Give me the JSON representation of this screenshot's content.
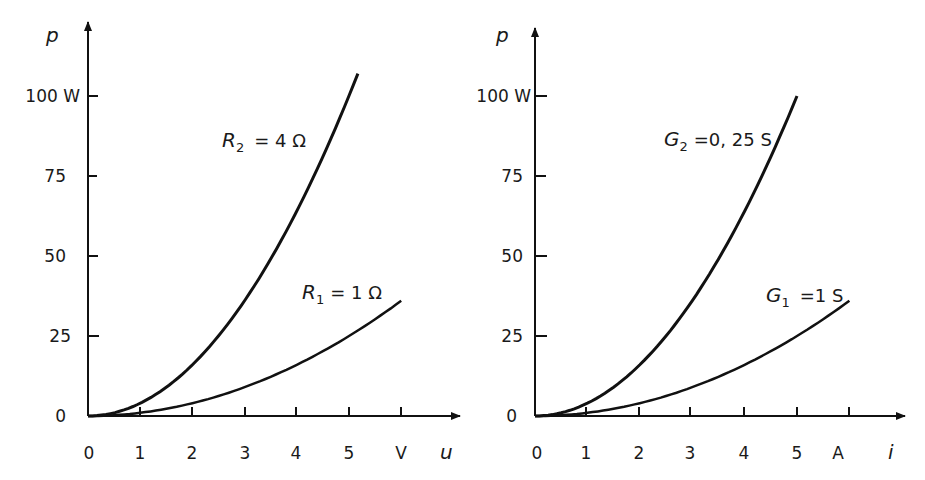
{
  "chart_data": [
    {
      "type": "line",
      "title": "",
      "xlabel": "u",
      "xunit": "V",
      "ylabel": "p",
      "yunit": "W",
      "x_ticks": [
        "0",
        "1",
        "2",
        "3",
        "4",
        "5",
        "V"
      ],
      "y_ticks": [
        "0",
        "25",
        "50",
        "75",
        "100 W"
      ],
      "xlim": [
        0,
        7
      ],
      "ylim": [
        0,
        110
      ],
      "grid": false,
      "series": [
        {
          "name": "R2 = 4 Ω",
          "label_var": "R",
          "label_sub": "2",
          "label_rest": "= 4 Ω",
          "x": [
            0,
            1,
            2,
            3,
            4,
            5,
            5.17
          ],
          "values": [
            0,
            4,
            16,
            36,
            64,
            100,
            107
          ]
        },
        {
          "name": "R1 = 1 Ω",
          "label_var": "R",
          "label_sub": "1",
          "label_rest": "= 1 Ω",
          "x": [
            0,
            1,
            2,
            3,
            4,
            5,
            6
          ],
          "values": [
            0,
            1,
            4,
            9,
            16,
            25,
            36
          ]
        }
      ]
    },
    {
      "type": "line",
      "title": "",
      "xlabel": "i",
      "xunit": "A",
      "ylabel": "p",
      "yunit": "W",
      "x_ticks": [
        "0",
        "1",
        "2",
        "3",
        "4",
        "5",
        "A"
      ],
      "y_ticks": [
        "0",
        "25",
        "50",
        "75",
        "100 W"
      ],
      "xlim": [
        0,
        7
      ],
      "ylim": [
        0,
        110
      ],
      "grid": false,
      "series": [
        {
          "name": "G2 = 0,25 S",
          "label_var": "G",
          "label_sub": "2",
          "label_rest": "=0, 25 S",
          "x": [
            0,
            1,
            2,
            3,
            4,
            5
          ],
          "values": [
            0,
            4,
            16,
            36,
            64,
            100
          ]
        },
        {
          "name": "G1 = 1 S",
          "label_var": "G",
          "label_sub": "1",
          "label_rest": "=1 S",
          "x": [
            0,
            1,
            2,
            3,
            4,
            5,
            6
          ],
          "values": [
            0,
            1,
            4,
            9,
            16,
            25,
            36
          ]
        }
      ]
    }
  ]
}
